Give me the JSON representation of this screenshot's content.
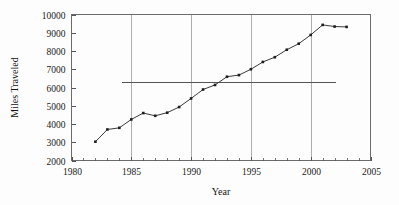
{
  "chart_data": {
    "type": "line",
    "title": "",
    "xlabel": "Year",
    "ylabel": "Miles Traveled",
    "xlim": [
      1980,
      2005
    ],
    "ylim": [
      2000,
      10000
    ],
    "xticks": [
      1980,
      1985,
      1990,
      1995,
      2000,
      2005
    ],
    "xtick_labels": [
      "1980",
      "1985",
      "1990",
      "1995",
      "2000",
      "2005"
    ],
    "yticks": [
      2000,
      3000,
      4000,
      5000,
      6000,
      7000,
      8000,
      9000,
      10000
    ],
    "ytick_labels": [
      "2000",
      "3000",
      "4000",
      "5000",
      "6000",
      "7000",
      "8000",
      "9000",
      "10000"
    ],
    "xminor_ticks": [
      1981,
      1982,
      1983,
      1984,
      1986,
      1987,
      1988,
      1989,
      1991,
      1992,
      1993,
      1994,
      1996,
      1997,
      1998,
      1999,
      2001,
      2002,
      2003,
      2004
    ],
    "grid": "vertical-major",
    "grid_x": [
      1985,
      1990,
      1995,
      2000
    ],
    "legend": "none",
    "marker": "square",
    "line_color": "#3a3a3a",
    "marker_color": "#1e1e1e",
    "x": [
      1982,
      1983,
      1984,
      1985,
      1986,
      1987,
      1988,
      1989,
      1990,
      1991,
      1992,
      1993,
      1994,
      1995,
      1996,
      1997,
      1998,
      1999,
      2000,
      2001,
      2002,
      2003
    ],
    "values": [
      3030,
      3700,
      3790,
      4250,
      4600,
      4450,
      4620,
      4930,
      5400,
      5890,
      6140,
      6590,
      6680,
      7000,
      7400,
      7660,
      8070,
      8400,
      8880,
      9430,
      9340,
      9320
    ],
    "series": [
      {
        "name": "Miles Traveled",
        "values": [
          3030,
          3700,
          3790,
          4250,
          4600,
          4450,
          4620,
          4930,
          5400,
          5890,
          6140,
          6590,
          6680,
          7000,
          7400,
          7660,
          8070,
          8400,
          8880,
          9430,
          9340,
          9320
        ]
      }
    ],
    "reference_lines": [
      {
        "name": "horizontal-reference-line",
        "orientation": "horizontal",
        "value": 6300,
        "x_start": 1984.2,
        "x_end": 2002.1,
        "color": "#555555"
      }
    ],
    "annotations": []
  }
}
